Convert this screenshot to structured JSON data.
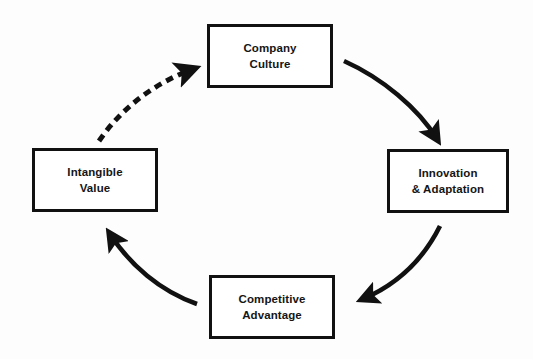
{
  "diagram": {
    "type": "cycle-diagram",
    "background_color": "#fdfdfd",
    "stroke_color": "#111111",
    "text_color": "#151515",
    "nodes": [
      {
        "id": "company-culture",
        "label": "Company\nCulture",
        "position": "top"
      },
      {
        "id": "innovation-adaptation",
        "label": "Innovation\n& Adaptation",
        "position": "right"
      },
      {
        "id": "competitive-advantage",
        "label": "Competitive\nAdvantage",
        "position": "bottom"
      },
      {
        "id": "intangible-value",
        "label": "Intangible\nValue",
        "position": "left"
      }
    ],
    "connectors": [
      {
        "id": "culture-to-innovation",
        "from": "company-culture",
        "to": "innovation-adaptation",
        "style": "solid",
        "direction": "clockwise"
      },
      {
        "id": "innovation-to-competitive",
        "from": "innovation-adaptation",
        "to": "competitive-advantage",
        "style": "solid",
        "direction": "clockwise"
      },
      {
        "id": "competitive-to-intangible",
        "from": "competitive-advantage",
        "to": "intangible-value",
        "style": "solid",
        "direction": "clockwise"
      },
      {
        "id": "intangible-to-culture",
        "from": "intangible-value",
        "to": "company-culture",
        "style": "dashed",
        "direction": "clockwise"
      }
    ]
  }
}
